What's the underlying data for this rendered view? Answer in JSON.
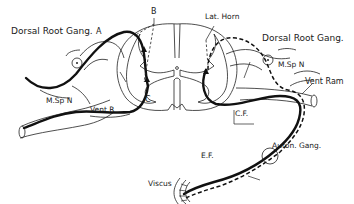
{
  "diagram": {
    "labels": {
      "dorsal_root_gang_left": "Dorsal Root Gang.",
      "a": "A",
      "b": "B",
      "c": "C",
      "lat_horn": "Lat. Horn",
      "dorsal_root_gang_right": "Dorsal Root Gang.",
      "m_sp_n_right": "M.Sp N",
      "vent_ram": "Vent Ram",
      "m_sp_n_left": "M.Sp N",
      "vent_r": "Vent.R",
      "c_f": "C.F.",
      "auton_gang": "Auton. Gang.",
      "e_f": "E.F.",
      "viscus": "Viscus"
    },
    "line_styles": {
      "solid_thick": "somatic / efferent pathway",
      "dashed": "afferent visceral pathway"
    },
    "colors": {
      "ink": "#111111",
      "background": "#ffffff"
    }
  }
}
